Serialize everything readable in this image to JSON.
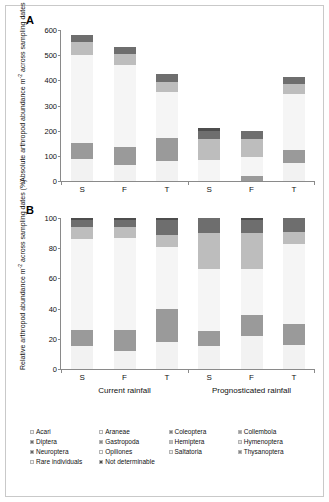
{
  "figure": {
    "panelA_letter": "A",
    "panelB_letter": "B",
    "panelA_ylabel_line1": "Absolute arthropod abundance m",
    "panelA_ylabel_sup": "-2",
    "panelA_ylabel_line2": "across sampling dates",
    "panelB_ylabel_line1": "Relative arthropod abundance m",
    "panelB_ylabel_sup": "-2",
    "panelB_ylabel_line2": "across sampling dates (%)"
  },
  "chart_data": [
    {
      "type": "bar",
      "panel": "A",
      "title": "Absolute arthropod abundance m-2 across sampling dates",
      "xlabel": "",
      "ylabel": "Absolute arthropod abundance m-2 across sampling dates",
      "ylim": [
        0,
        600
      ],
      "yticks": [
        0,
        100,
        200,
        300,
        400,
        500,
        600
      ],
      "grid": false,
      "legend_position": "bottom",
      "categories": [
        "S",
        "F",
        "T",
        "S",
        "F",
        "T"
      ],
      "groups": [
        "Current rainfall",
        "Prognosticated rainfall"
      ],
      "stacked": true,
      "series": [
        {
          "name": "Acari",
          "values": [
            88,
            64,
            80,
            0,
            0,
            70
          ]
        },
        {
          "name": "Collembola",
          "values": [
            62,
            72,
            92,
            0,
            18,
            52
          ]
        },
        {
          "name": "Rare individuals",
          "values": [
            350,
            325,
            180,
            85,
            78,
            225
          ]
        },
        {
          "name": "Hemiptera",
          "values": [
            52,
            45,
            42,
            80,
            72,
            40
          ]
        },
        {
          "name": "Diptera",
          "values": [
            30,
            25,
            30,
            32,
            30,
            25
          ]
        },
        {
          "name": "Not determinable",
          "values": [
            0,
            0,
            0,
            12,
            0,
            0
          ]
        }
      ]
    },
    {
      "type": "bar",
      "panel": "B",
      "title": "Relative arthropod abundance m-2 across sampling dates (%)",
      "xlabel": "",
      "ylabel": "Relative arthropod abundance m-2 across sampling dates (%)",
      "ylim": [
        0,
        100
      ],
      "yticks": [
        0,
        20,
        40,
        60,
        80,
        100
      ],
      "grid": false,
      "legend_position": "bottom",
      "categories": [
        "S",
        "F",
        "T",
        "S",
        "F",
        "T"
      ],
      "groups": [
        "Current rainfall",
        "Prognosticated rainfall"
      ],
      "stacked": true,
      "series": [
        {
          "name": "Acari",
          "values": [
            15,
            12,
            18,
            15,
            22,
            16
          ]
        },
        {
          "name": "Collembola",
          "values": [
            11,
            14,
            22,
            10,
            14,
            14
          ]
        },
        {
          "name": "Rare individuals",
          "values": [
            60,
            61,
            41,
            41,
            30,
            53
          ]
        },
        {
          "name": "Hemiptera",
          "values": [
            8,
            7,
            8,
            24,
            24,
            8
          ]
        },
        {
          "name": "Diptera",
          "values": [
            5,
            5,
            10,
            10,
            9,
            9
          ]
        },
        {
          "name": "Not determinable",
          "values": [
            1,
            1,
            1,
            0,
            1,
            0
          ]
        }
      ]
    }
  ],
  "axes": {
    "panelA_yticks": [
      "600",
      "500",
      "400",
      "300",
      "200",
      "100",
      "0"
    ],
    "panelB_yticks": [
      "100",
      "80",
      "60",
      "40",
      "20",
      "0"
    ],
    "xticklabels": [
      "S",
      "F",
      "T",
      "S",
      "F",
      "T"
    ],
    "grouplabels": [
      "Current rainfall",
      "Prognosticated rainfall"
    ]
  },
  "legend": {
    "items": [
      {
        "label": "Acari",
        "color": "#f2f2f2"
      },
      {
        "label": "Araneae",
        "color": "#fafafa"
      },
      {
        "label": "Coleoptera",
        "color": "#7f7f7f"
      },
      {
        "label": "Collembola",
        "color": "#9a9a9a"
      },
      {
        "label": "Diptera",
        "color": "#6e6e6e"
      },
      {
        "label": "Gastropoda",
        "color": "#8a8a8a"
      },
      {
        "label": "Hemiptera",
        "color": "#bdbdbd"
      },
      {
        "label": "Hymenoptera",
        "color": "#e0e0e0"
      },
      {
        "label": "Neuroptera",
        "color": "#666666"
      },
      {
        "label": "Opiliones",
        "color": "#fdfdfd"
      },
      {
        "label": "Saltatoria",
        "color": "#ededed"
      },
      {
        "label": "Thysanoptera",
        "color": "#878787"
      },
      {
        "label": "Rare individuals",
        "color": "#f5f5f5"
      },
      {
        "label": "Not determinable",
        "color": "#4d4d4d"
      }
    ]
  },
  "colors": {
    "acari": "#f2f2f2",
    "collembola": "#9a9a9a",
    "rare": "#f5f5f5",
    "hemiptera": "#bdbdbd",
    "diptera": "#6e6e6e",
    "notdet": "#4d4d4d",
    "axis": "#8a8a8a",
    "text": "#111111"
  }
}
